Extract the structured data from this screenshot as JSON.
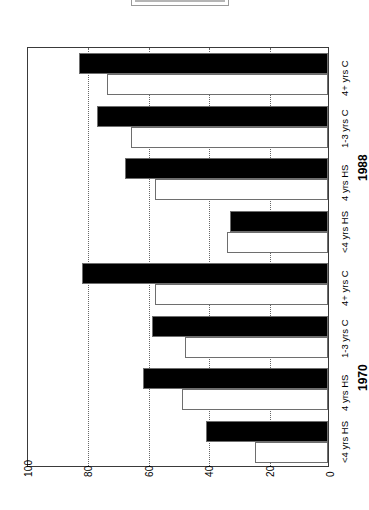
{
  "legend": {
    "present": true
  },
  "axis": {
    "tick_labels": [
      "0",
      "20",
      "40",
      "60",
      "80",
      "100"
    ],
    "min": 0,
    "max": 100
  },
  "groups": [
    {
      "label": "1970"
    },
    {
      "label": "1988"
    }
  ],
  "category_labels": [
    "<4 yrs HS",
    "4 yrs HS",
    "1-3 yrs C",
    "4+ yrs C"
  ],
  "chart_data": {
    "type": "bar",
    "orientation": "horizontal",
    "title": "",
    "xlabel": "",
    "ylabel": "",
    "ylim": [
      0,
      100
    ],
    "grid": true,
    "gridlines": [
      20,
      40,
      60,
      80
    ],
    "legend_position": "top",
    "categories": [
      "1970 <4 yrs HS",
      "1970 4 yrs HS",
      "1970 1-3 yrs C",
      "1970 4+ yrs C",
      "1988 <4 yrs HS",
      "1988 4 yrs HS",
      "1988 1-3 yrs C",
      "1988 4+ yrs C"
    ],
    "series": [
      {
        "name": "black",
        "fill": "#000000",
        "values": [
          41,
          62,
          59,
          82,
          33,
          68,
          77,
          83
        ]
      },
      {
        "name": "white",
        "fill": "#ffffff",
        "values": [
          25,
          49,
          48,
          58,
          34,
          58,
          66,
          74
        ]
      }
    ]
  }
}
